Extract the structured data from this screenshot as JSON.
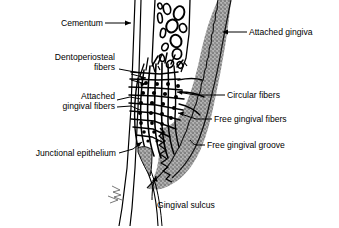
{
  "figure": {
    "background_color": "#ffffff",
    "ink_color": "#000000",
    "gingiva_fill_color": "#9a9a9a",
    "width": 339,
    "height": 228
  },
  "labels": {
    "cementum": "Cementum",
    "dentoperiosteal_line1": "Dentoperiosteal",
    "dentoperiosteal_line2": "fibers",
    "attached_gingival_line1": "Attached",
    "attached_gingival_line2": "gingival fibers",
    "junctional_epithelium": "Junctional epithelium",
    "attached_gingiva": "Attached gingiva",
    "circular_fibers": "Circular fibers",
    "free_gingival_fibers": "Free gingival fibers",
    "free_gingival_groove": "Free gingival groove",
    "gingival_sulcus": "Gingival sulcus"
  },
  "structures": {
    "alveolar_bone": "alveolar-bone-with-marrow-spaces",
    "tooth_root": "tooth-root-cementum-surface",
    "gingiva_band": "stippled-gingiva-band",
    "fiber_mesh": "gingival-fiber-bundle-mesh",
    "circular_fiber_dots": "circular-fiber-cross-sections",
    "sulcus": "gingival-sulcus-space",
    "signature": "artist-signature-mark"
  }
}
